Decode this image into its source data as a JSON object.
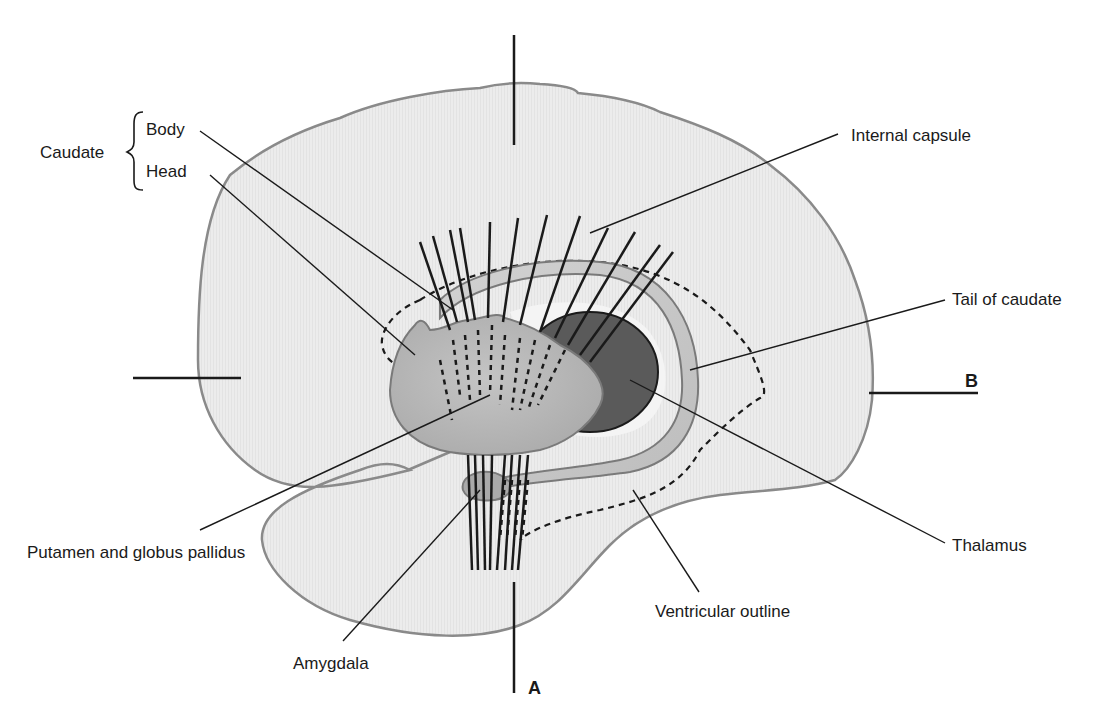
{
  "diagram": {
    "colors": {
      "brain_fill": "#ececec",
      "brain_outline": "#8a8a8a",
      "caudate_fill": "#b8b8b8",
      "thalamus_fill": "#5a5a5a",
      "leader_line": "#1a1a1a"
    },
    "labels": {
      "caudate": "Caudate",
      "body": "Body",
      "head": "Head",
      "internal_capsule": "Internal capsule",
      "tail_of_caudate": "Tail of caudate",
      "putamen_globus_pallidus": "Putamen and globus pallidus",
      "thalamus": "Thalamus",
      "ventricular_outline": "Ventricular outline",
      "amygdala": "Amygdala",
      "section_a": "A",
      "section_b": "B"
    }
  }
}
